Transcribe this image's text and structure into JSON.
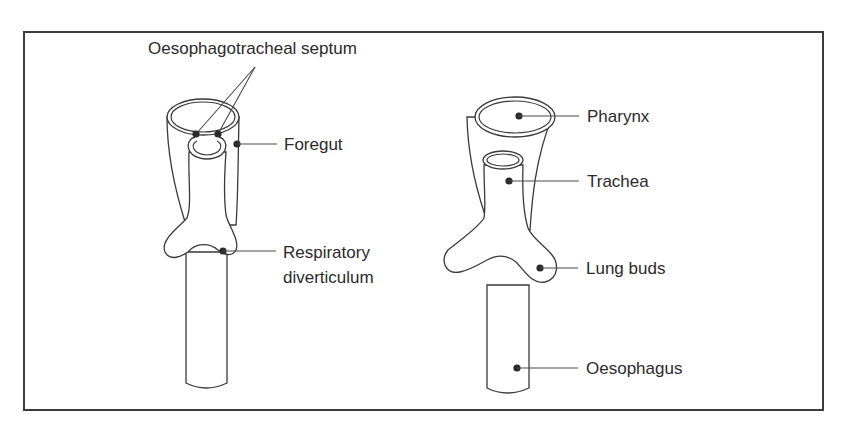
{
  "diagram": {
    "frame": {
      "border_color": "#3c3c3c"
    },
    "left_figure": {
      "labels": {
        "septum": "Oesophagotracheal septum",
        "foregut": "Foregut",
        "respiratory_line1": "Respiratory",
        "respiratory_line2": "diverticulum"
      }
    },
    "right_figure": {
      "labels": {
        "pharynx": "Pharynx",
        "trachea": "Trachea",
        "lung_buds": "Lung buds",
        "oesophagus": "Oesophagus"
      }
    },
    "colors": {
      "line": "#3a3a3a",
      "text": "#2b2b2b",
      "background": "#ffffff"
    }
  }
}
